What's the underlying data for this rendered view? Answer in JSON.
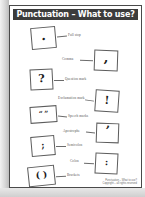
{
  "document": {
    "title": "Punctuation – What to use?",
    "type": "worksheet"
  },
  "items": [
    {
      "symbol": ".",
      "label": "Full stop",
      "side": "left",
      "glyph_class": "dot"
    },
    {
      "symbol": ",",
      "label": "Comma",
      "side": "right",
      "glyph_class": "dot"
    },
    {
      "symbol": "?",
      "label": "Question mark",
      "side": "left",
      "glyph_class": ""
    },
    {
      "symbol": "!",
      "label": "Exclamation mark",
      "side": "right",
      "glyph_class": ""
    },
    {
      "symbol": "“ ”",
      "label": "Speech marks",
      "side": "left",
      "glyph_class": "tiny"
    },
    {
      "symbol": "’",
      "label": "Apostrophe",
      "side": "right",
      "glyph_class": "dot"
    },
    {
      "symbol": ";",
      "label": "Semicolon",
      "side": "left",
      "glyph_class": "small"
    },
    {
      "symbol": ":",
      "label": "Colon",
      "side": "right",
      "glyph_class": "small"
    },
    {
      "symbol": "( )",
      "label": "Brackets",
      "side": "left",
      "glyph_class": "small"
    }
  ],
  "footer": {
    "line1": "Punctuation – What to use?",
    "line2": "Copyright – all rights reserved"
  },
  "colors": {
    "title_bar": "#3c3c3c",
    "title_text": "#ffffff",
    "page_border": "#4a4a4a",
    "box_border": "#5c5c5c",
    "leader_line": "#6b6b6b",
    "label_text": "#555555"
  }
}
